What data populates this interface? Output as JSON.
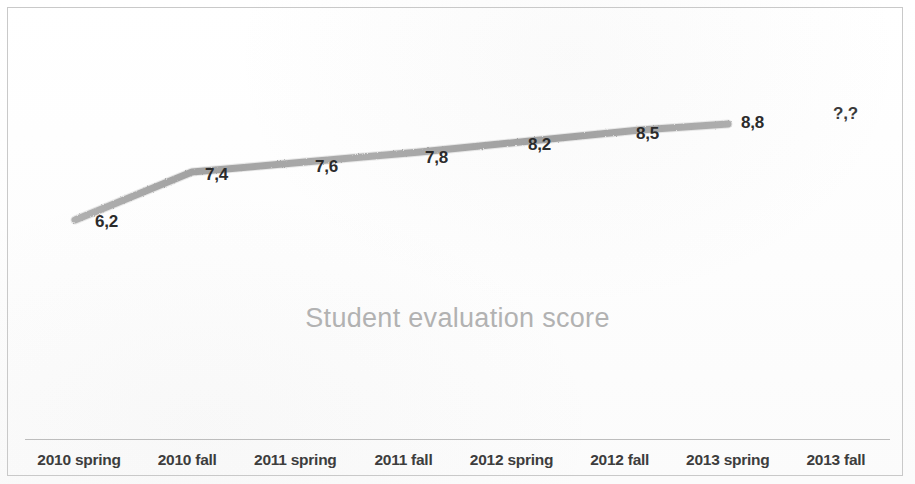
{
  "chart_data": {
    "type": "line",
    "title": "Student evaluation score",
    "xlabel": "",
    "ylabel": "",
    "grid": false,
    "legend": "none",
    "categories": [
      "2010 spring",
      "2010 fall",
      "2011 spring",
      "2011 fall",
      "2012 spring",
      "2012 fall",
      "2013 spring",
      "2013 fall"
    ],
    "series": [
      {
        "name": "Student evaluation score",
        "values": [
          6.2,
          7.4,
          7.6,
          7.8,
          8.2,
          8.5,
          8.8,
          null
        ],
        "labels": [
          "6,2",
          "7,4",
          "7,6",
          "7,8",
          "8,2",
          "8,5",
          "8,8",
          "?,?"
        ],
        "line_color": "#a8a8a8"
      }
    ],
    "ylim": [
      6.0,
      9.0
    ],
    "decimal_separator": ",",
    "unknown_label": "?,?",
    "unknown_category": "2013 fall"
  },
  "points": [
    {
      "label": "6,2",
      "cx": 75,
      "cy": 220,
      "lx": 95,
      "ly": 213
    },
    {
      "label": "7,4",
      "cx": 192,
      "cy": 172,
      "lx": 205,
      "ly": 166
    },
    {
      "label": "7,6",
      "cx": 305,
      "cy": 162,
      "lx": 315,
      "ly": 158
    },
    {
      "label": "7,8",
      "cx": 420,
      "cy": 152,
      "lx": 425,
      "ly": 149
    },
    {
      "label": "8,2",
      "cx": 530,
      "cy": 141,
      "lx": 528,
      "ly": 136
    },
    {
      "label": "8,5",
      "cx": 640,
      "cy": 130,
      "lx": 636,
      "ly": 125
    },
    {
      "label": "8,8",
      "cx": 728,
      "cy": 124,
      "lx": 741,
      "ly": 114
    }
  ],
  "unknown_point": {
    "label": "?,?",
    "lx": 833,
    "ly": 105
  },
  "colors": {
    "line": "#a8a8a8",
    "title_text": "#b2b2b2",
    "data_label_text": "#2b2b2b",
    "axis_label_text": "#3d3d3d",
    "axis_line": "#bdbdbd",
    "frame_border": "#c9c9c9",
    "background": "#fdfdfd"
  }
}
